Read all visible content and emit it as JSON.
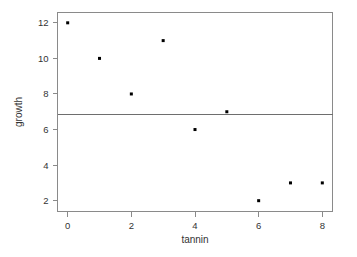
{
  "chart_data": {
    "type": "scatter",
    "title": "",
    "xlabel": "tannin",
    "ylabel": "growth",
    "x": [
      0,
      1,
      2,
      3,
      4,
      5,
      6,
      7,
      8
    ],
    "values": [
      12,
      10,
      8,
      11,
      6,
      7,
      2,
      3,
      3
    ],
    "points": [
      {
        "x": 0,
        "y": 12
      },
      {
        "x": 1,
        "y": 10
      },
      {
        "x": 2,
        "y": 8
      },
      {
        "x": 3,
        "y": 11
      },
      {
        "x": 4,
        "y": 6
      },
      {
        "x": 5,
        "y": 7
      },
      {
        "x": 6,
        "y": 2
      },
      {
        "x": 7,
        "y": 3
      },
      {
        "x": 8,
        "y": 3
      }
    ],
    "xticks": [
      0,
      2,
      4,
      6,
      8
    ],
    "xtick_labels": [
      "0",
      "2",
      "4",
      "6",
      "8"
    ],
    "yticks": [
      2,
      4,
      6,
      8,
      10,
      12
    ],
    "ytick_labels": [
      "2",
      "4",
      "6",
      "8",
      "10",
      "12"
    ],
    "xlim": [
      -0.32,
      8.32
    ],
    "ylim": [
      1.42,
      12.58
    ],
    "grid": false,
    "legend": null,
    "annotations": [],
    "reference_lines": [
      {
        "orientation": "horizontal",
        "value": 6.89,
        "label": "",
        "color": "#6e6e6e"
      }
    ],
    "marker": {
      "shape": "square",
      "size": 3,
      "color": "#000000"
    },
    "colors": {
      "background": "#ffffff",
      "frame": "#8a8a8a",
      "text": "#333333",
      "point": "#000000",
      "reference_line": "#6e6e6e"
    }
  }
}
